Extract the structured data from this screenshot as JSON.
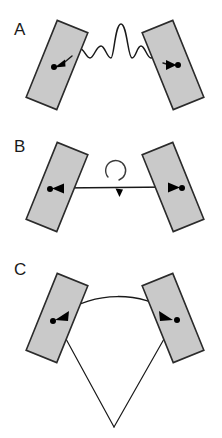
{
  "figure": {
    "width": 222,
    "height": 438,
    "background": "#ffffff",
    "plate_fill": "#c9c9c9",
    "plate_stroke": "#2b2b2b",
    "line_color": "#1a1a1a",
    "dot_color": "#000000"
  },
  "panels": [
    {
      "id": "A",
      "label": "A",
      "label_x": 14,
      "label_y": 35,
      "coupling": "wavy-spring-line",
      "left_plate": {
        "cx": 57,
        "cy": 65,
        "width": 33,
        "height": 83,
        "rotation": 22
      },
      "right_plate": {
        "cx": 173,
        "cy": 65,
        "width": 33,
        "height": 83,
        "rotation": -22
      },
      "left_dot": {
        "x": 54,
        "y": 67
      },
      "right_dot": {
        "x": 176,
        "y": 65
      },
      "left_arrow_dir": "left",
      "right_arrow_dir": "right"
    },
    {
      "id": "B",
      "label": "B",
      "label_x": 14,
      "label_y": 152,
      "coupling": "straight-double-arrow-with-rotation",
      "left_plate": {
        "cx": 57,
        "cy": 187,
        "width": 33,
        "height": 83,
        "rotation": 22
      },
      "right_plate": {
        "cx": 173,
        "cy": 187,
        "width": 33,
        "height": 83,
        "rotation": -22
      },
      "left_dot": {
        "x": 54,
        "y": 189
      },
      "right_dot": {
        "x": 176,
        "y": 188
      },
      "left_arrow_dir": "left",
      "right_arrow_dir": "right",
      "rotation_symbol": {
        "cx": 112,
        "cy": 186,
        "r": 10,
        "direction": "clockwise"
      }
    },
    {
      "id": "C",
      "label": "C",
      "label_x": 14,
      "label_y": 275,
      "coupling": "curved-arc-with-angle-vertex",
      "left_plate": {
        "cx": 57,
        "cy": 318,
        "width": 33,
        "height": 83,
        "rotation": 22
      },
      "right_plate": {
        "cx": 173,
        "cy": 318,
        "width": 33,
        "height": 83,
        "rotation": -22
      },
      "left_dot": {
        "x": 54,
        "y": 320
      },
      "right_dot": {
        "x": 176,
        "y": 318
      },
      "left_arrow_dir": "left",
      "right_arrow_dir": "right",
      "vertex": {
        "x": 114,
        "y": 427
      }
    }
  ]
}
